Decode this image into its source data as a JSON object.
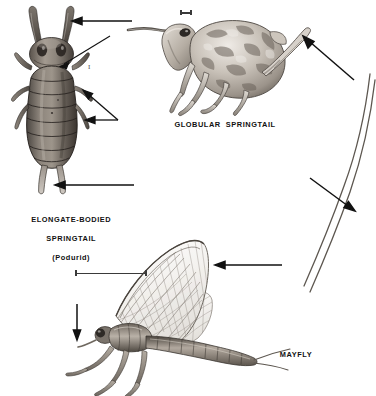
{
  "plate": {
    "background_color": "#ffffff",
    "ink_color": "#1a1a1a",
    "width": 376,
    "height": 396,
    "medium": "halftone scientific illustration"
  },
  "figures": [
    {
      "id": "elongate-springtail",
      "caption_lines": [
        "ELONGATE-BODIED",
        "SPRINGTAIL",
        "(Podurid)"
      ],
      "caption_text": "ELONGATE-BODIED SPRINGTAIL (Podurid)",
      "view": "dorsal",
      "scale_marker": "I",
      "pointers": [
        {
          "name": "antenna-arrow",
          "target": "antenna",
          "direction": "left"
        },
        {
          "name": "thorax-leader",
          "target": "thorax",
          "direction": "diagonal"
        },
        {
          "name": "legs-double-arrow",
          "target": "legs",
          "direction": "left"
        },
        {
          "name": "furcula-arrow",
          "target": "furcula",
          "direction": "left"
        }
      ]
    },
    {
      "id": "globular-springtail",
      "caption_lines": [
        "GLOBULAR  SPRINGTAIL"
      ],
      "caption_text": "GLOBULAR SPRINGTAIL",
      "view": "lateral",
      "scale_marker": "—",
      "pointers": [
        {
          "name": "furcula-arrow",
          "target": "furcula",
          "direction": "up-left"
        }
      ]
    },
    {
      "id": "mayfly",
      "caption_lines": [
        "MAYFLY"
      ],
      "caption_text": "MAYFLY",
      "view": "lateral",
      "scale_marker": "—",
      "pointers": [
        {
          "name": "wing-arrow",
          "target": "forewing",
          "direction": "left"
        },
        {
          "name": "head-arrow",
          "target": "head",
          "direction": "down"
        },
        {
          "name": "cerci-arrow",
          "target": "caudal-filaments",
          "direction": "down-right"
        }
      ]
    }
  ],
  "labels": {
    "elongate": "ELONGATE-BODIED",
    "elongate2": "SPRINGTAIL",
    "elongate3": "(Podurid)",
    "globular": "GLOBULAR  SPRINGTAIL",
    "mayfly": "MAYFLY",
    "roman_one": "I"
  }
}
